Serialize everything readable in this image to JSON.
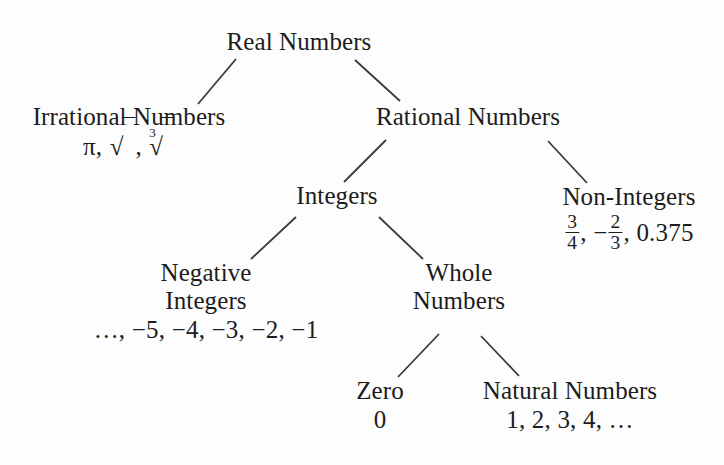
{
  "diagram": {
    "line_color": "#3a3a3a",
    "text_color": "#1c1c1c",
    "background": "#fdfdfd",
    "nodes": {
      "real": {
        "label": "Real Numbers",
        "examples": ""
      },
      "irrational": {
        "label": "Irrational Numbers",
        "examples": "π, √2, ∛5",
        "example_items": [
          "π",
          "√2",
          "∛5"
        ]
      },
      "rational": {
        "label": "Rational Numbers",
        "examples": ""
      },
      "integers": {
        "label": "Integers",
        "examples": ""
      },
      "nonintegers": {
        "label": "Non-Integers",
        "examples": "3/4, −2/3, 0.375",
        "example_items": [
          "3/4",
          "−2/3",
          "0.375"
        ],
        "fraction_1": {
          "numerator": "3",
          "denominator": "4"
        },
        "fraction_2": {
          "sign": "−",
          "numerator": "2",
          "denominator": "3"
        },
        "decimal": "0.375"
      },
      "negative_integers": {
        "label_line1": "Negative",
        "label_line2": "Integers",
        "examples": "…, −5, −4, −3, −2, −1"
      },
      "whole": {
        "label_line1": "Whole",
        "label_line2": "Numbers",
        "examples": ""
      },
      "zero": {
        "label": "Zero",
        "examples": "0"
      },
      "natural": {
        "label": "Natural Numbers",
        "examples": "1, 2, 3, 4, …"
      }
    },
    "edges": [
      {
        "name": "real-to-irrational",
        "from": "real",
        "to": "irrational",
        "x1": 236,
        "y1": 59,
        "x2": 198,
        "y2": 104
      },
      {
        "name": "real-to-rational",
        "from": "real",
        "to": "rational",
        "x1": 355,
        "y1": 60,
        "x2": 400,
        "y2": 101
      },
      {
        "name": "rational-to-integers",
        "from": "rational",
        "to": "integers",
        "x1": 386,
        "y1": 140,
        "x2": 344,
        "y2": 182
      },
      {
        "name": "rational-to-nonintegers",
        "from": "rational",
        "to": "nonintegers",
        "x1": 548,
        "y1": 141,
        "x2": 587,
        "y2": 183
      },
      {
        "name": "integers-to-negative",
        "from": "integers",
        "to": "negative_integers",
        "x1": 296,
        "y1": 217,
        "x2": 251,
        "y2": 259
      },
      {
        "name": "integers-to-whole",
        "from": "integers",
        "to": "whole",
        "x1": 379,
        "y1": 217,
        "x2": 423,
        "y2": 259
      },
      {
        "name": "whole-to-zero",
        "from": "whole",
        "to": "zero",
        "x1": 439,
        "y1": 334,
        "x2": 398,
        "y2": 377
      },
      {
        "name": "whole-to-natural",
        "from": "whole",
        "to": "natural",
        "x1": 481,
        "y1": 336,
        "x2": 519,
        "y2": 376
      }
    ]
  }
}
